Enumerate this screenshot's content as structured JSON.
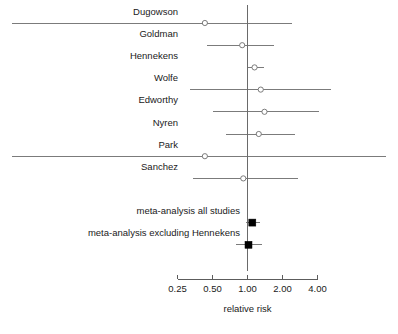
{
  "chart_data": {
    "type": "forest",
    "title": "",
    "xlabel": "relative risk",
    "ylabel": "",
    "xscale": "log",
    "xlim": [
      0.25,
      4.0
    ],
    "grid": false,
    "legend": null,
    "reference_line": 1.0,
    "xticks": [
      {
        "value": 0.25,
        "label": "0.25"
      },
      {
        "value": 0.5,
        "label": "0.50"
      },
      {
        "value": 1.0,
        "label": "1.00"
      },
      {
        "value": 2.0,
        "label": "2.00"
      },
      {
        "value": 4.0,
        "label": "4.00"
      }
    ],
    "rows": [
      {
        "label": "Dugowson",
        "estimate": 0.43,
        "ci_low": 0.15,
        "ci_high": 2.4,
        "kind": "study",
        "clipped_low": true,
        "clipped_high": false
      },
      {
        "label": "Goldman",
        "estimate": 0.9,
        "ci_low": 0.45,
        "ci_high": 1.7,
        "kind": "study",
        "clipped_low": false,
        "clipped_high": false
      },
      {
        "label": "Hennekens",
        "estimate": 1.15,
        "ci_low": 1.0,
        "ci_high": 1.4,
        "kind": "study",
        "clipped_low": false,
        "clipped_high": false
      },
      {
        "label": "Wolfe",
        "estimate": 1.3,
        "ci_low": 0.32,
        "ci_high": 5.2,
        "kind": "study",
        "clipped_low": false,
        "clipped_high": false
      },
      {
        "label": "Edworthy",
        "estimate": 1.4,
        "ci_low": 0.5,
        "ci_high": 4.1,
        "kind": "study",
        "clipped_low": false,
        "clipped_high": false
      },
      {
        "label": "Nyren",
        "estimate": 1.25,
        "ci_low": 0.65,
        "ci_high": 2.55,
        "kind": "study",
        "clipped_low": false,
        "clipped_high": false
      },
      {
        "label": "Park",
        "estimate": 0.43,
        "ci_low": 0.04,
        "ci_high": 28.0,
        "kind": "study",
        "clipped_low": true,
        "clipped_high": true
      },
      {
        "label": "Sanchez",
        "estimate": 0.92,
        "ci_low": 0.34,
        "ci_high": 2.7,
        "kind": "study",
        "clipped_low": false,
        "clipped_high": false
      },
      {
        "label": "meta-analysis all studies",
        "estimate": 1.1,
        "ci_low": 0.98,
        "ci_high": 1.28,
        "kind": "summary",
        "clipped_low": false,
        "clipped_high": false
      },
      {
        "label": "meta-analysis excluding Hennekens",
        "estimate": 1.02,
        "ci_low": 0.79,
        "ci_high": 1.32,
        "kind": "summary",
        "clipped_low": false,
        "clipped_high": false
      }
    ]
  },
  "colors": {
    "background": "#ffffff",
    "text": "#1a1a1a",
    "ci": "#6d6d6d",
    "axis": "#4a4a4a",
    "reference": "#5a5a5a",
    "summary_marker": "#000000",
    "study_marker_fill": "#ffffff"
  }
}
